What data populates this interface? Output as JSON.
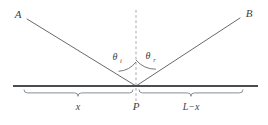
{
  "figure": {
    "kind": "optics-reflection-diagram",
    "canvas": {
      "width": 268,
      "height": 125
    },
    "background_color": "#ffffff",
    "stroke_color": "#55585c",
    "surface_color": "#4a4d50",
    "dash_color": "#9a9da1",
    "label_color": "#3f3f3f"
  },
  "labels": {
    "incident_ray_endpoint": "A",
    "reflected_ray_endpoint": "B",
    "vertex_point": "P",
    "angle_incidence_symbol": "θ",
    "angle_incidence_subscript": "i",
    "angle_reflection_symbol": "θ",
    "angle_reflection_subscript": "r",
    "left_segment": "x",
    "right_segment": "L−x"
  },
  "geometry": {
    "vertex": {
      "x": 136,
      "y": 86
    },
    "ray_a_start": {
      "x": 27,
      "y": 19
    },
    "ray_b_end": {
      "x": 240,
      "y": 18
    },
    "surface_line": {
      "x1": 13,
      "x2": 258,
      "y": 86
    },
    "normal_line": {
      "x": 136,
      "y1": 10,
      "y2": 101
    },
    "brace_left": {
      "x1": 24,
      "x2": 133,
      "y": 93
    },
    "brace_right": {
      "x1": 139,
      "x2": 243,
      "y": 93
    }
  }
}
